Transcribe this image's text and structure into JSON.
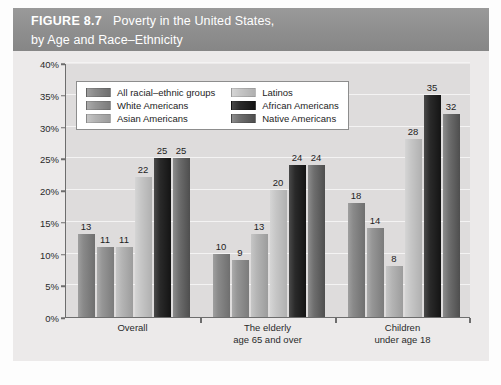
{
  "header": {
    "figure_number": "FIGURE 8.7",
    "title_line1": "Poverty in the United States,",
    "title_line2": "by Age and Race–Ethnicity"
  },
  "legend": {
    "items": [
      {
        "label": "All racial–ethnic groups",
        "swatch": "sw-all",
        "color": "#8a8a8a"
      },
      {
        "label": "Latinos",
        "swatch": "sw-lat",
        "color": "#c6c6c6"
      },
      {
        "label": "White Americans",
        "swatch": "sw-white",
        "color": "#969696"
      },
      {
        "label": "African Americans",
        "swatch": "sw-afr",
        "color": "#2a2a2a"
      },
      {
        "label": "Asian Americans",
        "swatch": "sw-asian",
        "color": "#b4b4b4"
      },
      {
        "label": "Native Americans",
        "swatch": "sw-nat",
        "color": "#6e6e6e"
      }
    ]
  },
  "chart_data": {
    "type": "bar",
    "title": "Poverty in the United States, by Age and Race–Ethnicity",
    "xlabel": "",
    "ylabel": "Percentage",
    "ylim": [
      0,
      40
    ],
    "ytick_labels": [
      "0%",
      "5%",
      "10%",
      "15%",
      "20%",
      "25%",
      "30%",
      "35%",
      "40%"
    ],
    "ytick_values": [
      0,
      5,
      10,
      15,
      20,
      25,
      30,
      35,
      40
    ],
    "grid": true,
    "legend_position": "upper-left-inside",
    "categories": [
      "Overall",
      "The elderly age 65 and over",
      "Children under age 18"
    ],
    "category_labels": [
      {
        "line1": "Overall",
        "line2": ""
      },
      {
        "line1": "The elderly",
        "line2": "age 65 and over"
      },
      {
        "line1": "Children",
        "line2": "under age 18"
      }
    ],
    "series": [
      {
        "name": "All racial–ethnic groups",
        "values": [
          13,
          10,
          18
        ]
      },
      {
        "name": "White Americans",
        "values": [
          11,
          9,
          14
        ]
      },
      {
        "name": "Asian Americans",
        "values": [
          11,
          13,
          8
        ]
      },
      {
        "name": "Latinos",
        "values": [
          22,
          20,
          28
        ]
      },
      {
        "name": "African Americans",
        "values": [
          25,
          24,
          35
        ]
      },
      {
        "name": "Native Americans",
        "values": [
          25,
          24,
          32
        ]
      }
    ]
  }
}
